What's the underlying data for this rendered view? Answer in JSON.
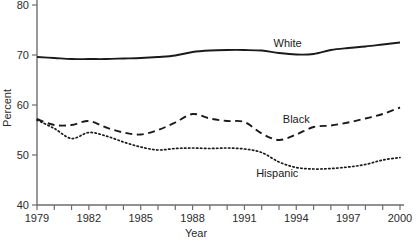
{
  "chart_data": {
    "type": "line",
    "title": "",
    "xlabel": "Year",
    "ylabel": "Percent",
    "xlim": [
      1979,
      2000
    ],
    "ylim": [
      40,
      80
    ],
    "grid": false,
    "legend_position": "inline-annotations",
    "y_ticks": [
      40,
      50,
      60,
      70,
      80
    ],
    "y_tick_labels": [
      "40",
      "50",
      "60",
      "70",
      "80"
    ],
    "x_ticks": [
      1979,
      1980,
      1981,
      1982,
      1983,
      1984,
      1985,
      1986,
      1987,
      1988,
      1989,
      1990,
      1991,
      1992,
      1993,
      1994,
      1995,
      1996,
      1997,
      1998,
      1999,
      2000
    ],
    "x_tick_labels": [
      "1979",
      "",
      "",
      "1982",
      "",
      "",
      "1985",
      "",
      "",
      "1988",
      "",
      "",
      "1991",
      "",
      "",
      "1994",
      "",
      "",
      "1997",
      "",
      "",
      "2000"
    ],
    "x": [
      1979,
      1980,
      1981,
      1982,
      1983,
      1984,
      1985,
      1986,
      1987,
      1988,
      1989,
      1990,
      1991,
      1992,
      1993,
      1994,
      1995,
      1996,
      1997,
      1998,
      1999,
      2000
    ],
    "series": [
      {
        "name": "White",
        "style": "solid",
        "label_x": 1993.5,
        "label_y": 71.6,
        "values": [
          69.6,
          69.4,
          69.2,
          69.2,
          69.2,
          69.3,
          69.4,
          69.6,
          69.9,
          70.6,
          70.9,
          71.0,
          71.0,
          70.9,
          70.4,
          70.1,
          70.2,
          71.0,
          71.4,
          71.7,
          72.1,
          72.5
        ]
      },
      {
        "name": "Black",
        "style": "dashed",
        "label_x": 1994.0,
        "label_y": 56.5,
        "values": [
          57.2,
          56.0,
          56.0,
          56.8,
          55.5,
          54.5,
          54.1,
          55.0,
          56.5,
          58.2,
          57.3,
          56.8,
          56.6,
          54.3,
          53.0,
          54.1,
          55.6,
          55.9,
          56.5,
          57.3,
          58.2,
          59.5
        ]
      },
      {
        "name": "Hispanic",
        "style": "dotted",
        "label_x": 1992.9,
        "label_y": 45.6,
        "values": [
          57.0,
          55.3,
          53.3,
          54.5,
          53.8,
          52.6,
          51.6,
          51.0,
          51.3,
          51.4,
          51.3,
          51.4,
          51.2,
          50.5,
          48.6,
          47.5,
          47.2,
          47.3,
          47.6,
          48.1,
          49.0,
          49.5
        ]
      }
    ]
  },
  "annotations": {
    "white_label": "White",
    "black_label": "Black",
    "hispanic_label": "Hispanic"
  },
  "axes": {
    "y_title": "Percent",
    "x_title": "Year",
    "y_label_40": "40",
    "y_label_50": "50",
    "y_label_60": "60",
    "y_label_70": "70",
    "y_label_80": "80",
    "x_label_1979": "1979",
    "x_label_1982": "1982",
    "x_label_1985": "1985",
    "x_label_1988": "1988",
    "x_label_1991": "1991",
    "x_label_1994": "1994",
    "x_label_1997": "1997",
    "x_label_2000": "2000"
  }
}
